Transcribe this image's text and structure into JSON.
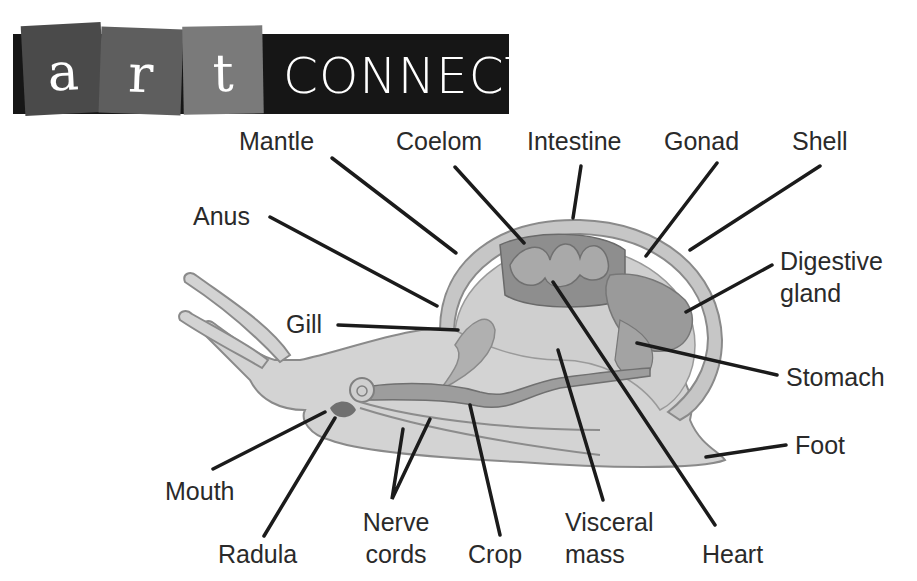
{
  "header": {
    "tiles": [
      "a",
      "r",
      "t"
    ],
    "title": "CONNECTION",
    "banner_color": "#161616",
    "tile_colors": [
      "#4a4a4a",
      "#5e5e5e",
      "#7a7a7a"
    ]
  },
  "diagram": {
    "labels": {
      "mantle": "Mantle",
      "coelom": "Coelom",
      "intestine": "Intestine",
      "gonad": "Gonad",
      "shell": "Shell",
      "anus": "Anus",
      "digestive_gland_1": "Digestive",
      "digestive_gland_2": "gland",
      "gill": "Gill",
      "stomach": "Stomach",
      "foot": "Foot",
      "mouth": "Mouth",
      "radula": "Radula",
      "nerve_cords_1": "Nerve",
      "nerve_cords_2": "cords",
      "crop": "Crop",
      "visceral_mass_1": "Visceral",
      "visceral_mass_2": "mass",
      "heart": "Heart"
    }
  }
}
